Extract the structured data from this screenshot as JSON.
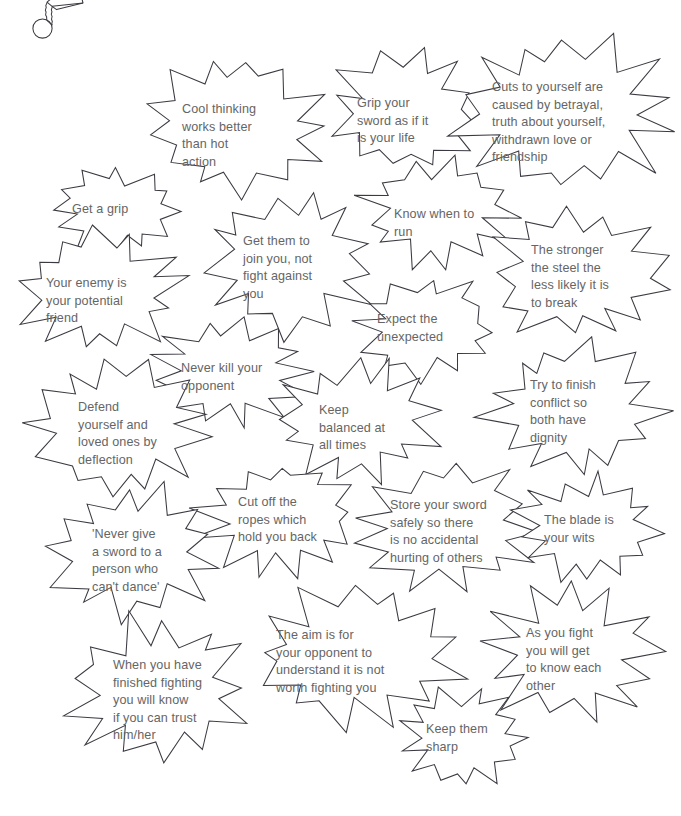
{
  "page": {
    "background_color": "#ffffff",
    "outline_color": "#3a3a42",
    "text_color": "#656565",
    "width": 681,
    "height": 816
  },
  "doodle": {
    "name": "sword-hilt-sketch",
    "description": "hand-drawn sword hilt with round pommel, wrapped grip and blade angled up-right"
  },
  "bursts": [
    {
      "id": "cool-thinking",
      "lines": [
        "Cool thinking",
        "works better",
        "than hot",
        "action"
      ],
      "cx": 236,
      "cy": 126,
      "rx": 90,
      "ry": 72,
      "spikes": 13,
      "inner": 0.69,
      "seed": 11,
      "tx": 182,
      "ty": 101
    },
    {
      "id": "grip-your-sword",
      "lines": [
        "Grip your",
        "sword as if it",
        "is your life"
      ],
      "cx": 405,
      "cy": 110,
      "rx": 78,
      "ry": 62,
      "spikes": 12,
      "inner": 0.66,
      "seed": 23,
      "tx": 357,
      "ty": 95
    },
    {
      "id": "cuts-to-yourself",
      "lines": [
        "Cuts to yourself are",
        "caused by betrayal,",
        "truth about yourself,",
        "withdrawn love or",
        "friendship"
      ],
      "cx": 567,
      "cy": 112,
      "rx": 113,
      "ry": 78,
      "spikes": 14,
      "inner": 0.7,
      "seed": 7,
      "tx": 492,
      "ty": 79
    },
    {
      "id": "get-a-grip",
      "lines": [
        "Get a grip"
      ],
      "cx": 116,
      "cy": 211,
      "rx": 65,
      "ry": 45,
      "spikes": 12,
      "inner": 0.67,
      "seed": 31,
      "tx": 72,
      "ty": 201
    },
    {
      "id": "know-when-to-run",
      "lines": [
        "Know when to",
        "run"
      ],
      "cx": 437,
      "cy": 212,
      "rx": 78,
      "ry": 55,
      "spikes": 13,
      "inner": 0.67,
      "seed": 42,
      "tx": 394,
      "ty": 206
    },
    {
      "id": "get-them-to-join",
      "lines": [
        "Get them to",
        "join you, not",
        "fight against",
        "you"
      ],
      "cx": 290,
      "cy": 262,
      "rx": 88,
      "ry": 72,
      "spikes": 13,
      "inner": 0.68,
      "seed": 53,
      "tx": 243,
      "ty": 233
    },
    {
      "id": "the-stronger-the-steel",
      "lines": [
        "The stronger",
        "the steel the",
        "less likely it is",
        "to break"
      ],
      "cx": 578,
      "cy": 273,
      "rx": 93,
      "ry": 68,
      "spikes": 13,
      "inner": 0.69,
      "seed": 64,
      "tx": 531,
      "ty": 242
    },
    {
      "id": "your-enemy",
      "lines": [
        "Your enemy is",
        "your potential",
        "friend"
      ],
      "cx": 101,
      "cy": 292,
      "rx": 82,
      "ry": 62,
      "spikes": 13,
      "inner": 0.68,
      "seed": 75,
      "tx": 46,
      "ty": 275
    },
    {
      "id": "expect-the-unexpected",
      "lines": [
        "Expect the",
        "unexpected"
      ],
      "cx": 425,
      "cy": 328,
      "rx": 72,
      "ry": 52,
      "spikes": 12,
      "inner": 0.68,
      "seed": 86,
      "tx": 377,
      "ty": 311
    },
    {
      "id": "never-kill-your-opponent",
      "lines": [
        "Never kill your",
        "opponent"
      ],
      "cx": 231,
      "cy": 372,
      "rx": 81,
      "ry": 55,
      "spikes": 13,
      "inner": 0.68,
      "seed": 97,
      "tx": 181,
      "ty": 360
    },
    {
      "id": "try-to-finish-conflict",
      "lines": [
        "Try to finish",
        "conflict so",
        "both have",
        "dignity"
      ],
      "cx": 573,
      "cy": 410,
      "rx": 90,
      "ry": 67,
      "spikes": 13,
      "inner": 0.69,
      "seed": 108,
      "tx": 530,
      "ty": 377
    },
    {
      "id": "defend-yourself",
      "lines": [
        "Defend",
        "yourself and",
        "loved ones by",
        "deflection"
      ],
      "cx": 120,
      "cy": 426,
      "rx": 92,
      "ry": 72,
      "spikes": 13,
      "inner": 0.68,
      "seed": 119,
      "tx": 78,
      "ty": 399
    },
    {
      "id": "keep-balanced",
      "lines": [
        "Keep",
        "balanced at",
        "all times"
      ],
      "cx": 357,
      "cy": 420,
      "rx": 82,
      "ry": 60,
      "spikes": 13,
      "inner": 0.68,
      "seed": 130,
      "tx": 319,
      "ty": 402
    },
    {
      "id": "cut-off-the-ropes",
      "lines": [
        "Cut off the",
        "ropes which",
        "hold you back"
      ],
      "cx": 277,
      "cy": 519,
      "rx": 82,
      "ry": 58,
      "spikes": 13,
      "inner": 0.68,
      "seed": 141,
      "tx": 238,
      "ty": 494
    },
    {
      "id": "store-your-sword",
      "lines": [
        "Store your sword",
        "safely so there",
        "is no accidental",
        "hurting of others"
      ],
      "cx": 447,
      "cy": 527,
      "rx": 95,
      "ry": 66,
      "spikes": 13,
      "inner": 0.69,
      "seed": 152,
      "tx": 390,
      "ty": 497
    },
    {
      "id": "the-blade-is-your-wits",
      "lines": [
        "The blade is",
        "your wits"
      ],
      "cx": 588,
      "cy": 528,
      "rx": 73,
      "ry": 54,
      "spikes": 13,
      "inner": 0.68,
      "seed": 163,
      "tx": 544,
      "ty": 512
    },
    {
      "id": "never-give-a-sword",
      "lines": [
        "'Never give",
        "a sword to a",
        "person who",
        "can't dance'"
      ],
      "cx": 133,
      "cy": 551,
      "rx": 88,
      "ry": 68,
      "spikes": 13,
      "inner": 0.68,
      "seed": 174,
      "tx": 92,
      "ty": 526
    },
    {
      "id": "the-aim-is-for",
      "lines": [
        "The aim is for",
        "your opponent to",
        "understand it is not",
        "worth fighting you"
      ],
      "cx": 357,
      "cy": 655,
      "rx": 105,
      "ry": 70,
      "spikes": 13,
      "inner": 0.7,
      "seed": 185,
      "tx": 276,
      "ty": 627
    },
    {
      "id": "as-you-fight",
      "lines": [
        "As you fight",
        "you will get",
        "to know each",
        "other"
      ],
      "cx": 570,
      "cy": 655,
      "rx": 90,
      "ry": 68,
      "spikes": 13,
      "inner": 0.68,
      "seed": 196,
      "tx": 526,
      "ty": 625
    },
    {
      "id": "when-you-have-finished",
      "lines": [
        "When you have",
        "finished fighting",
        "you will know",
        "if you can trust",
        "him/her"
      ],
      "cx": 158,
      "cy": 690,
      "rx": 93,
      "ry": 75,
      "spikes": 13,
      "inner": 0.68,
      "seed": 207,
      "tx": 113,
      "ty": 657
    },
    {
      "id": "keep-them-sharp",
      "lines": [
        "Keep them",
        "sharp"
      ],
      "cx": 464,
      "cy": 738,
      "rx": 65,
      "ry": 50,
      "spikes": 13,
      "inner": 0.66,
      "seed": 218,
      "tx": 426,
      "ty": 721
    }
  ]
}
